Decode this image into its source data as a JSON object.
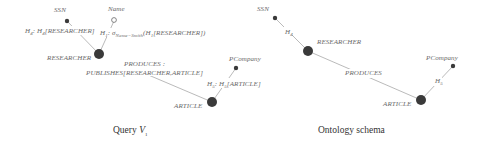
{
  "query_view": {
    "caption": "Query",
    "caption_var": "V",
    "caption_sub": "1",
    "nodes": {
      "ssn": "SSN",
      "name": "Name",
      "researcher": "RESEARCHER",
      "article": "ARTICLE",
      "pcompany": "PCompany"
    },
    "edges": {
      "ssn_edge_h": "H",
      "ssn_edge_h_sub": "4",
      "ssn_edge_rest": ": H",
      "ssn_edge_rest_sub": "4",
      "ssn_edge_tail": "[RESEARCHER]",
      "name_edge_h": "H",
      "name_edge_h_sub": "1",
      "name_edge_sigma": ": σ",
      "name_edge_sigma_sub": "Name=Smith",
      "name_edge_tail": "(H",
      "name_edge_tail_sub": "1",
      "name_edge_tail2": "[RESEARCHER])",
      "produces_line1": "PRODUCES :",
      "produces_line2": "PUBLISHES[RESEARCHER,ARTICLE]",
      "pcompany_edge_h": "H",
      "pcompany_edge_h_sub": "5",
      "pcompany_edge_rest": ": H",
      "pcompany_edge_rest_sub": "5",
      "pcompany_edge_tail": "[ARTICLE]"
    }
  },
  "ontology_schema": {
    "caption": "Ontology schema",
    "nodes": {
      "ssn": "SSN",
      "researcher": "RESEARCHER",
      "article": "ARTICLE",
      "pcompany": "PCompany"
    },
    "edges": {
      "ssn_edge": "H",
      "ssn_edge_sub": "4",
      "produces": "PRODUCES",
      "pcompany_edge": "H",
      "pcompany_edge_sub": "5"
    }
  },
  "colors": {
    "node": "#3a3a3a",
    "edge": "#9a9a9a",
    "label": "#6a6a6a"
  }
}
